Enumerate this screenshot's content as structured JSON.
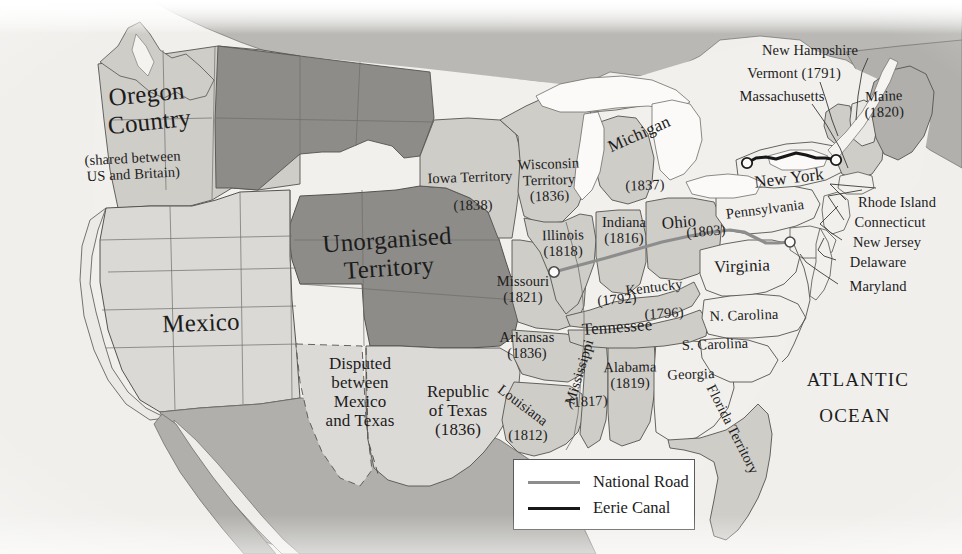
{
  "map": {
    "title": "United States in 1838",
    "ocean_label": "ATLANTIC\nOCEAN",
    "colors": {
      "paper": "#f7f6f3",
      "ocean": "#efeeea",
      "state_light": "#f2f0ec",
      "state_mid": "#cfcdc8",
      "territory_dark": "#8d8c88",
      "canada": "#b9b8b4",
      "border": "#4a4a4a",
      "national_road": "#8d8d8d",
      "eerie_canal": "#181818",
      "text": "#1c1c1c"
    }
  },
  "legend": {
    "items": [
      {
        "label": "National Road",
        "color": "#8d8d8d",
        "key": "national-road"
      },
      {
        "label": "Eerie Canal",
        "color": "#181818",
        "key": "eerie-canal"
      }
    ]
  },
  "labels": [
    {
      "id": "oregon-country",
      "text": "Oregon\nCountry",
      "x": 148,
      "y": 108,
      "size": "big",
      "rotate": -6
    },
    {
      "id": "oregon-shared",
      "text": "(shared between\nUS and Britain)",
      "x": 133,
      "y": 166,
      "size": "sm",
      "rotate": -3
    },
    {
      "id": "unorganised-territory",
      "text": "Unorganised\nTerritory",
      "x": 388,
      "y": 254,
      "size": "big",
      "rotate": -4
    },
    {
      "id": "mexico",
      "text": "Mexico",
      "x": 201,
      "y": 323,
      "size": "big",
      "rotate": -2
    },
    {
      "id": "disputed-mexico-texas",
      "text": "Disputed\nbetween\nMexico\nand Texas",
      "x": 360,
      "y": 392,
      "size": "mid",
      "rotate": 0
    },
    {
      "id": "republic-of-texas",
      "text": "Republic\nof Texas\n(1836)",
      "x": 458,
      "y": 411,
      "size": "mid",
      "rotate": 0
    },
    {
      "id": "iowa-territory",
      "text": "Iowa Territory",
      "x": 470,
      "y": 177,
      "size": "sm",
      "rotate": -2
    },
    {
      "id": "iowa-territory-year",
      "text": "(1838)",
      "x": 473,
      "y": 205,
      "size": "sm",
      "rotate": -1
    },
    {
      "id": "wisconsin-territory",
      "text": "Wisconsin\nTerritory\n(1836)",
      "x": 549,
      "y": 180,
      "size": "sm",
      "rotate": -2
    },
    {
      "id": "michigan",
      "text": "Michigan",
      "x": 639,
      "y": 134,
      "size": "mid",
      "rotate": -24
    },
    {
      "id": "michigan-year",
      "text": "(1837)",
      "x": 645,
      "y": 185,
      "size": "sm",
      "rotate": -2
    },
    {
      "id": "illinois",
      "text": "Illinois\n(1818)",
      "x": 563,
      "y": 243,
      "size": "sm",
      "rotate": -1
    },
    {
      "id": "indiana",
      "text": "Indiana\n(1816)",
      "x": 624,
      "y": 230,
      "size": "sm",
      "rotate": 0
    },
    {
      "id": "ohio",
      "text": "Ohio",
      "x": 679,
      "y": 222,
      "size": "mid",
      "rotate": -5
    },
    {
      "id": "ohio-year",
      "text": "(1803)",
      "x": 706,
      "y": 231,
      "size": "sm",
      "rotate": -5
    },
    {
      "id": "missouri",
      "text": "Missouri\n(1821)",
      "x": 523,
      "y": 289,
      "size": "sm",
      "rotate": 0
    },
    {
      "id": "kentucky",
      "text": "Kentucky",
      "x": 654,
      "y": 287,
      "size": "sm",
      "rotate": -7
    },
    {
      "id": "kentucky-year",
      "text": "(1792)",
      "x": 617,
      "y": 299,
      "size": "sm",
      "rotate": -5
    },
    {
      "id": "tennessee",
      "text": "Tennessee",
      "x": 617,
      "y": 327,
      "size": "mid",
      "rotate": -4
    },
    {
      "id": "tennessee-year",
      "text": "(1796)",
      "x": 664,
      "y": 313,
      "size": "sm",
      "rotate": -3
    },
    {
      "id": "arkansas",
      "text": "Arkansas\n(1836)",
      "x": 527,
      "y": 345,
      "size": "sm",
      "rotate": 0
    },
    {
      "id": "mississippi",
      "text": "Mississippi",
      "x": 579,
      "y": 372,
      "size": "sm",
      "rotate": -73
    },
    {
      "id": "mississippi-year",
      "text": "(1817)",
      "x": 588,
      "y": 401,
      "size": "sm",
      "rotate": -3
    },
    {
      "id": "louisiana",
      "text": "Louisiana",
      "x": 523,
      "y": 405,
      "size": "sm",
      "rotate": 37
    },
    {
      "id": "louisiana-year",
      "text": "(1812)",
      "x": 528,
      "y": 435,
      "size": "sm",
      "rotate": 0
    },
    {
      "id": "alabama",
      "text": "Alabama\n(1819)",
      "x": 630,
      "y": 375,
      "size": "sm",
      "rotate": -1
    },
    {
      "id": "georgia",
      "text": "Georgia",
      "x": 691,
      "y": 374,
      "size": "sm",
      "rotate": -2
    },
    {
      "id": "florida-territory",
      "text": "Florida Territory",
      "x": 733,
      "y": 429,
      "size": "sm",
      "rotate": 63
    },
    {
      "id": "n-carolina",
      "text": "N. Carolina",
      "x": 744,
      "y": 315,
      "size": "sm",
      "rotate": -2
    },
    {
      "id": "s-carolina",
      "text": "S. Carolina",
      "x": 715,
      "y": 344,
      "size": "sm",
      "rotate": -2
    },
    {
      "id": "virginia",
      "text": "Virginia",
      "x": 742,
      "y": 266,
      "size": "mid",
      "rotate": -2
    },
    {
      "id": "pennsylvania",
      "text": "Pennsylvania",
      "x": 765,
      "y": 209,
      "size": "sm",
      "rotate": -7
    },
    {
      "id": "new-york",
      "text": "New York",
      "x": 789,
      "y": 178,
      "size": "mid",
      "rotate": -7
    },
    {
      "id": "maine",
      "text": "Maine\n(1820)",
      "x": 884,
      "y": 104,
      "size": "sm",
      "rotate": -2
    },
    {
      "id": "new-hampshire",
      "text": "New Hampshire",
      "x": 810,
      "y": 50,
      "size": "sm",
      "rotate": 0
    },
    {
      "id": "vermont",
      "text": "Vermont (1791)",
      "x": 794,
      "y": 73,
      "size": "sm",
      "rotate": 0
    },
    {
      "id": "massachusetts",
      "text": "Massachusetts",
      "x": 782,
      "y": 96,
      "size": "sm",
      "rotate": 0
    },
    {
      "id": "rhode-island",
      "text": "Rhode Island",
      "x": 897,
      "y": 202,
      "size": "sm",
      "rotate": 0
    },
    {
      "id": "connecticut",
      "text": "Connecticut",
      "x": 890,
      "y": 222,
      "size": "sm",
      "rotate": 0
    },
    {
      "id": "new-jersey",
      "text": "New Jersey",
      "x": 887,
      "y": 242,
      "size": "sm",
      "rotate": 0
    },
    {
      "id": "delaware",
      "text": "Delaware",
      "x": 878,
      "y": 262,
      "size": "sm",
      "rotate": 0
    },
    {
      "id": "maryland",
      "text": "Maryland",
      "x": 878,
      "y": 286,
      "size": "sm",
      "rotate": 0
    },
    {
      "id": "atlantic-ocean-1",
      "text": "ATLANTIC",
      "x": 858,
      "y": 380,
      "size": "ocean",
      "rotate": 0
    },
    {
      "id": "atlantic-ocean-2",
      "text": "OCEAN",
      "x": 855,
      "y": 416,
      "size": "ocean",
      "rotate": 0
    }
  ],
  "routes": {
    "national_road": {
      "name": "National Road",
      "west_terminus": {
        "x": 554,
        "y": 272
      },
      "east_terminus": {
        "x": 790,
        "y": 242
      }
    },
    "eerie_canal": {
      "name": "Eerie Canal",
      "west_terminus": {
        "x": 747,
        "y": 163
      },
      "east_terminus": {
        "x": 836,
        "y": 160
      }
    }
  }
}
